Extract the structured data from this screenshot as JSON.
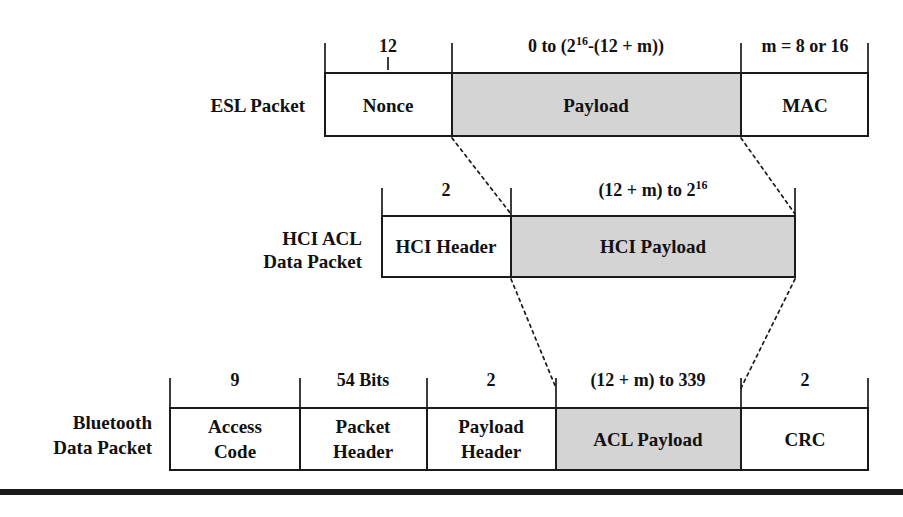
{
  "diagram": {
    "colors": {
      "payload_fill": "#d4d4d4",
      "plain_fill": "#ffffff",
      "line": "#1a1a1a"
    },
    "rows": [
      {
        "id": "esl",
        "label_lines": [
          "ESL Packet"
        ],
        "fields": [
          {
            "name": "Nonce",
            "size": "12",
            "shaded": false
          },
          {
            "name": "Payload",
            "size_prefix": "0 to (2",
            "size_sup": "16",
            "size_suffix": "-(12 + m))",
            "shaded": true
          },
          {
            "name": "MAC",
            "size": "m = 8 or 16",
            "shaded": false
          }
        ]
      },
      {
        "id": "hci",
        "label_lines": [
          "HCI ACL",
          "Data Packet"
        ],
        "fields": [
          {
            "name": "HCI Header",
            "size": "2",
            "shaded": false
          },
          {
            "name": "HCI Payload",
            "size_prefix": "(12 + m) to 2",
            "size_sup": "16",
            "size_suffix": "",
            "shaded": true
          }
        ]
      },
      {
        "id": "bluetooth",
        "label_lines": [
          "Bluetooth",
          "Data Packet"
        ],
        "fields": [
          {
            "name_line1": "Access",
            "name_line2": "Code",
            "size": "9",
            "shaded": false
          },
          {
            "name_line1": "Packet",
            "name_line2": "Header",
            "size": "54 Bits",
            "shaded": false
          },
          {
            "name_line1": "Payload",
            "name_line2": "Header",
            "size": "2",
            "shaded": false
          },
          {
            "name": "ACL Payload",
            "size": "(12 + m) to 339",
            "shaded": true
          },
          {
            "name": "CRC",
            "size": "2",
            "shaded": false
          }
        ]
      }
    ]
  }
}
